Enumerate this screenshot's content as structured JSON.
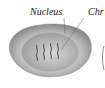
{
  "labels": {
    "nucleus": "Nucleus",
    "chromosome": "Chr"
  },
  "colors": {
    "cytoplasm_outer": "#9a9a9a",
    "cytoplasm_inner": "#c8c8c8",
    "nucleus": "#b0b0b0",
    "chromosome": "#555555"
  }
}
